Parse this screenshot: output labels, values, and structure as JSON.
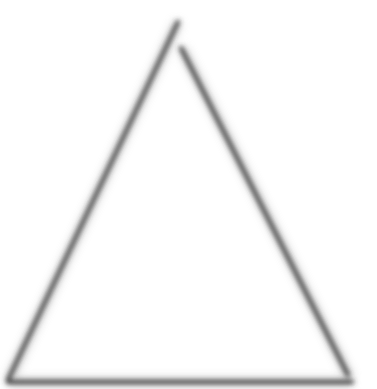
{
  "figure": {
    "shape": "triangle-outline",
    "stroke_color": "#3a3a3a",
    "background": "#ffffff",
    "label": ""
  }
}
